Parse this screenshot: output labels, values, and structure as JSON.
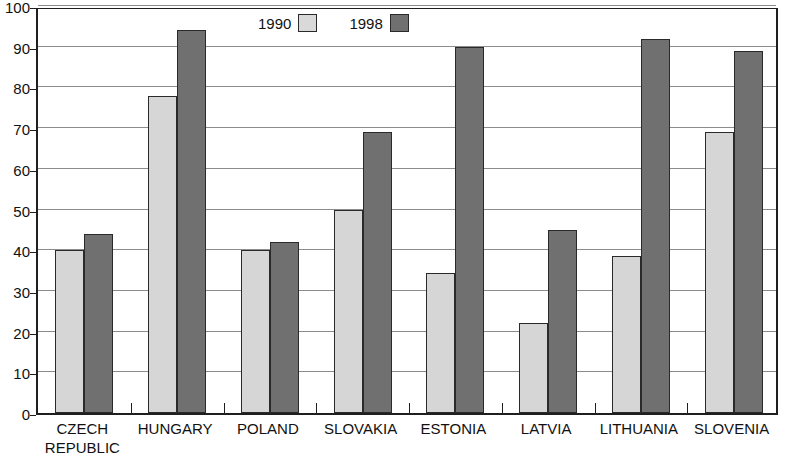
{
  "chart_data": {
    "type": "bar",
    "title": "",
    "subtitle": "",
    "xlabel": "",
    "ylabel": "",
    "ylim": [
      0,
      100
    ],
    "ytick_labels": [
      "0",
      "10",
      "20",
      "30",
      "40",
      "50",
      "60",
      "70",
      "80",
      "90",
      "100"
    ],
    "ytick_values": [
      0,
      10,
      20,
      30,
      40,
      50,
      60,
      70,
      80,
      90,
      100
    ],
    "grid": true,
    "legend_position": "top-center",
    "categories": [
      "CZECH\nREPUBLIC",
      "HUNGARY",
      "POLAND",
      "SLOVAKIA",
      "ESTONIA",
      "LATVIA",
      "LITHUANIA",
      "SLOVENIA"
    ],
    "series": [
      {
        "name": "1990",
        "color": "#d6d6d6",
        "values": [
          40,
          78,
          40,
          50,
          34.5,
          22,
          38.5,
          69
        ]
      },
      {
        "name": "1998",
        "color": "#707070",
        "values": [
          44,
          94,
          42,
          69,
          90,
          45,
          92,
          89
        ]
      }
    ]
  },
  "legend": {
    "items": [
      {
        "label": "1990",
        "swatch": "s1990"
      },
      {
        "label": "1998",
        "swatch": "s1998"
      }
    ]
  }
}
